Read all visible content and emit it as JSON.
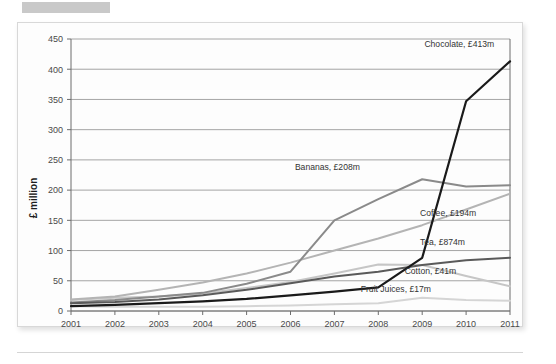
{
  "page": {
    "redaction_bar": "redacted-heading"
  },
  "chart_data": {
    "type": "line",
    "title": "",
    "subtitle": "",
    "xlabel": "",
    "ylabel": "£ million",
    "categories": [
      "2001",
      "2002",
      "2003",
      "2004",
      "2005",
      "2006",
      "2007",
      "2008",
      "2009",
      "2010",
      "2011"
    ],
    "x": [
      2001,
      2002,
      2003,
      2004,
      2005,
      2006,
      2007,
      2008,
      2009,
      2010,
      2011
    ],
    "xlim": [
      2001,
      2011
    ],
    "ylim": [
      0,
      450
    ],
    "ytick_labels": [
      "0",
      "50",
      "100",
      "150",
      "200",
      "250",
      "300",
      "350",
      "400",
      "450"
    ],
    "yticks": [
      0,
      50,
      100,
      150,
      200,
      250,
      300,
      350,
      400,
      450
    ],
    "grid": true,
    "legend_position": "inline-end-labels",
    "series": [
      {
        "name": "Chocolate",
        "label": "Chocolate, £413m",
        "end_value_text": "£413m",
        "color": "#1a1a1a",
        "width": 2.2,
        "values": [
          8,
          10,
          13,
          16,
          20,
          26,
          32,
          39,
          88,
          347,
          413
        ],
        "label_x": 2009.05,
        "label_y": 437,
        "anchor": "start"
      },
      {
        "name": "Bananas",
        "label": "Bananas, £208m",
        "end_value_text": "£208m",
        "color": "#8a8a8a",
        "width": 2.0,
        "values": [
          14,
          18,
          24,
          30,
          45,
          65,
          150,
          185,
          218,
          206,
          208
        ],
        "label_x": 2006.1,
        "label_y": 233,
        "anchor": "start"
      },
      {
        "name": "Coffee",
        "label": "Coffee, £194m",
        "end_value_text": "£194m",
        "color": "#b4b4b4",
        "width": 2.0,
        "values": [
          19,
          24,
          35,
          47,
          62,
          80,
          100,
          120,
          142,
          168,
          194
        ],
        "label_x": 2008.95,
        "label_y": 158,
        "anchor": "start"
      },
      {
        "name": "Tea",
        "label": "Tea, £874m",
        "end_value_text": "£874m",
        "color": "#5a5a5a",
        "width": 2.0,
        "values": [
          13,
          15,
          19,
          26,
          35,
          46,
          57,
          65,
          76,
          84,
          88
        ],
        "label_x": 2008.95,
        "label_y": 110,
        "anchor": "start"
      },
      {
        "name": "Cotton",
        "label": "Cotton, £41m",
        "end_value_text": "£41m",
        "color": "#c6c6c6",
        "width": 2.0,
        "values": [
          18,
          22,
          24,
          29,
          38,
          48,
          62,
          77,
          76,
          58,
          41
        ],
        "label_x": 2008.6,
        "label_y": 62,
        "anchor": "start"
      },
      {
        "name": "Fruit Juices",
        "label": "Fruit Juices, £17m",
        "end_value_text": "£17m",
        "color": "#d5d5d5",
        "width": 2.0,
        "values": [
          8,
          7,
          7,
          7,
          8,
          9,
          11,
          13,
          22,
          18,
          17
        ],
        "label_x": 2007.6,
        "label_y": 31,
        "anchor": "start"
      }
    ]
  }
}
